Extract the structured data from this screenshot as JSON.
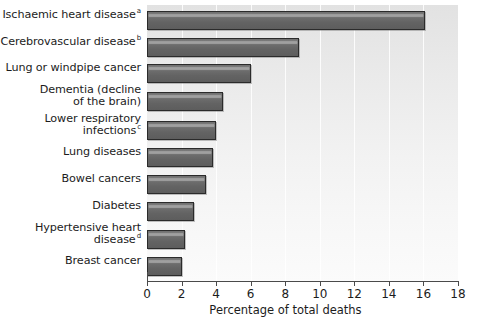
{
  "chart_data": {
    "type": "bar",
    "orientation": "horizontal",
    "title": "",
    "xlabel": "Percentage of total deaths",
    "ylabel": "",
    "xlim": [
      0,
      18
    ],
    "xticks": [
      0,
      2,
      4,
      6,
      8,
      10,
      12,
      14,
      16,
      18
    ],
    "grid": true,
    "grid_axis": "x",
    "legend": null,
    "categories": [
      "Ischaemic heart disease",
      "Cerebrovascular disease",
      "Lung or windpipe cancer",
      "Dementia (decline of the brain)",
      "Lower respiratory infections",
      "Lung diseases",
      "Bowel cancers",
      "Diabetes",
      "Hypertensive heart disease",
      "Breast cancer"
    ],
    "values": [
      16.1,
      8.8,
      6.0,
      4.4,
      4.0,
      3.8,
      3.4,
      2.7,
      2.2,
      2.0
    ],
    "footnote_markers": [
      "a",
      "b",
      "",
      "",
      "c",
      "",
      "",
      "",
      "d",
      ""
    ],
    "bar_color": "#6a6a6a",
    "bar_edge_color": "#2b2b2b",
    "plot_background": "#eeeeee"
  },
  "axis": {
    "x_title": "Percentage of total deaths",
    "ticks": [
      "0",
      "2",
      "4",
      "6",
      "8",
      "10",
      "12",
      "14",
      "16",
      "18"
    ]
  },
  "labels": [
    {
      "lines": [
        "Ischaemic heart disease"
      ],
      "sup": "a"
    },
    {
      "lines": [
        "Cerebrovascular disease"
      ],
      "sup": "b"
    },
    {
      "lines": [
        "Lung or windpipe cancer"
      ],
      "sup": ""
    },
    {
      "lines": [
        "Dementia (decline",
        "of the brain)"
      ],
      "sup": ""
    },
    {
      "lines": [
        "Lower respiratory",
        "infections"
      ],
      "sup": "c"
    },
    {
      "lines": [
        "Lung diseases"
      ],
      "sup": ""
    },
    {
      "lines": [
        "Bowel cancers"
      ],
      "sup": ""
    },
    {
      "lines": [
        "Diabetes"
      ],
      "sup": ""
    },
    {
      "lines": [
        "Hypertensive heart",
        "disease"
      ],
      "sup": "d"
    },
    {
      "lines": [
        "Breast cancer"
      ],
      "sup": ""
    }
  ]
}
